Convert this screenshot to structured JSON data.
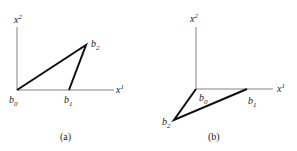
{
  "figure": {
    "panels": [
      {
        "id": "a",
        "caption": "(a)",
        "axis_labels": {
          "x": "x",
          "x_sup": "1",
          "y": "x",
          "y_sup": "2"
        },
        "points": [
          {
            "name": "b",
            "sub": "0"
          },
          {
            "name": "b",
            "sub": "1"
          },
          {
            "name": "b",
            "sub": "2"
          }
        ]
      },
      {
        "id": "b",
        "caption": "(b)",
        "axis_labels": {
          "x": "x",
          "x_sup": "1",
          "y": "x",
          "y_sup": "2"
        },
        "points": [
          {
            "name": "b",
            "sub": "0"
          },
          {
            "name": "b",
            "sub": "1"
          },
          {
            "name": "b",
            "sub": "2"
          }
        ]
      }
    ],
    "colors": {
      "axis": "#555555",
      "edge": "#111111",
      "text": "#222222"
    }
  }
}
